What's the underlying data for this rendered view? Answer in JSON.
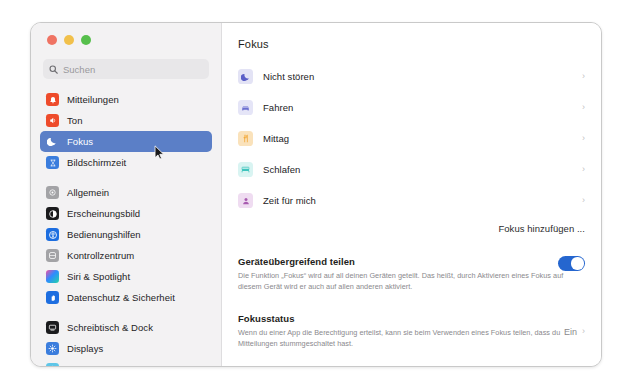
{
  "window": {
    "traffic_lights": [
      {
        "name": "close",
        "color": "#ef7363"
      },
      {
        "name": "minimize",
        "color": "#f1c04b"
      },
      {
        "name": "maximize",
        "color": "#56bf4c"
      }
    ]
  },
  "search": {
    "placeholder": "Suchen",
    "value": "",
    "icon": "search-icon"
  },
  "sidebar": {
    "groups": [
      {
        "items": [
          {
            "label": "Mitteilungen",
            "icon": "notifications-icon",
            "color": "#ee4b2b",
            "selected": false
          },
          {
            "label": "Ton",
            "icon": "sound-icon",
            "color": "#ee4b2b",
            "selected": false
          },
          {
            "label": "Fokus",
            "icon": "focus-moon-icon",
            "color": "#5b5fc7",
            "selected": true
          },
          {
            "label": "Bildschirmzeit",
            "icon": "screentime-icon",
            "color": "#3b7ddd",
            "selected": false
          }
        ]
      },
      {
        "items": [
          {
            "label": "Allgemein",
            "icon": "general-gear-icon",
            "color": "#a3a3a6",
            "selected": false
          },
          {
            "label": "Erscheinungsbild",
            "icon": "appearance-icon",
            "color": "#1b1b1d",
            "selected": false
          },
          {
            "label": "Bedienungshilfen",
            "icon": "accessibility-icon",
            "color": "#1d6ee0",
            "selected": false
          },
          {
            "label": "Kontrollzentrum",
            "icon": "control-center-icon",
            "color": "#a3a3a6",
            "selected": false
          },
          {
            "label": "Siri & Spotlight",
            "icon": "siri-icon",
            "color": "#7b4ad0",
            "selected": false
          },
          {
            "label": "Datenschutz & Sicherheit",
            "icon": "privacy-hand-icon",
            "color": "#1d6ee0",
            "selected": false
          }
        ]
      },
      {
        "items": [
          {
            "label": "Schreibtisch & Dock",
            "icon": "desktop-dock-icon",
            "color": "#1b1b1d",
            "selected": false
          },
          {
            "label": "Displays",
            "icon": "displays-icon",
            "color": "#3b7ddd",
            "selected": false
          },
          {
            "label": "Hintergrundbild",
            "icon": "wallpaper-icon",
            "color": "#5fc6e8",
            "selected": false
          }
        ]
      }
    ]
  },
  "main": {
    "title": "Fokus",
    "focus_modes": [
      {
        "label": "Nicht stören",
        "icon": "moon-icon",
        "color": "#5b5fc7"
      },
      {
        "label": "Fahren",
        "icon": "car-icon",
        "color": "#6b6fd0"
      },
      {
        "label": "Mittag",
        "icon": "fork-knife-icon",
        "color": "#f2a93b"
      },
      {
        "label": "Schlafen",
        "icon": "bed-icon",
        "color": "#3fc4bd"
      },
      {
        "label": "Zeit für mich",
        "icon": "person-icon",
        "color": "#a85bb0"
      }
    ],
    "add_focus_label": "Fokus hinzufügen ...",
    "share_across_devices": {
      "title": "Geräteübergreifend teilen",
      "description": "Die Funktion „Fokus“ wird auf all deinen Geräten geteilt. Das heißt, durch Aktivieren eines Fokus auf diesem Gerät wird er auch auf allen anderen aktiviert.",
      "toggle_on": true,
      "toggle_color": "#2566cf"
    },
    "focus_status": {
      "title": "Fokusstatus",
      "description": "Wenn du einer App die Berechtigung erteilst, kann sie beim Verwenden eines Fokus teilen, dass du Mitteilungen stummgeschaltet hast.",
      "value": "Ein",
      "chevron": "›"
    },
    "chevron_glyph": "›"
  }
}
